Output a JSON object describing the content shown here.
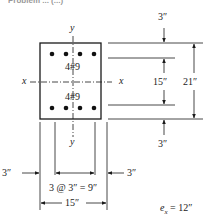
{
  "heading": {
    "text": "Problem ... (...)",
    "note": "partially cut off at top edge"
  },
  "section": {
    "width_label": "15″",
    "height_label": "21″",
    "bars_top": {
      "label": "4#9",
      "count": 4
    },
    "bars_bottom": {
      "label": "4#9",
      "count": 4
    }
  },
  "axes": {
    "x_left": "x",
    "x_right": "x",
    "y_top": "y",
    "y_bottom": "y"
  },
  "dimensions": {
    "top_cover": "3″",
    "bar_spacing_vertical": "15″",
    "total_height": "21″",
    "bottom_cover": "3″",
    "left_cover": "3″",
    "right_cover": "3″",
    "bar_spacing_horizontal": "3 @ 3″ = 9″",
    "total_width": "15″"
  },
  "eccentricity": {
    "label_e": "e",
    "label_sub": "x",
    "label_value": " = 12″"
  },
  "colors": {
    "line": "#1a1a1a",
    "text": "#222222",
    "background": "#ffffff"
  }
}
